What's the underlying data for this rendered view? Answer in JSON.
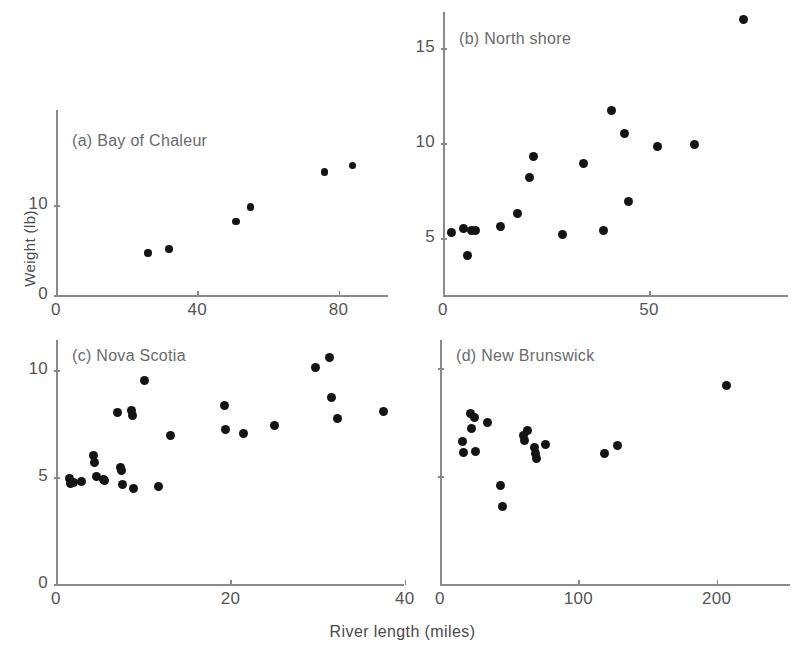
{
  "figure": {
    "xlabel": "River length (miles)",
    "ylabel": "Weight (lb)"
  },
  "chart_data": {
    "type": "scatter",
    "title": "",
    "xlabel": "River length (miles)",
    "ylabel": "Weight (lb)",
    "grid": false,
    "legend": "none",
    "marker": "filled circle",
    "marker_color": "#141414",
    "panels": [
      {
        "key": "a",
        "label": "(a) Bay of Chaleur",
        "xlim": [
          0,
          95
        ],
        "ylim": [
          0,
          16
        ],
        "xticks": [
          0,
          40,
          80
        ],
        "xticklabels": [
          "0",
          "40",
          "80"
        ],
        "yticks": [
          0,
          10
        ],
        "yticklabels": [
          "0",
          "10"
        ],
        "n": 6,
        "points": [
          {
            "x": 26,
            "y": 4.7
          },
          {
            "x": 32,
            "y": 5.1
          },
          {
            "x": 51,
            "y": 8.2
          },
          {
            "x": 55,
            "y": 9.8
          },
          {
            "x": 76,
            "y": 13.7
          },
          {
            "x": 84,
            "y": 14.4
          }
        ]
      },
      {
        "key": "b",
        "label": "(b) North shore",
        "xlim": [
          0,
          80
        ],
        "ylim": [
          3,
          17
        ],
        "xticks": [
          0,
          50
        ],
        "xticklabels": [
          "0",
          "50"
        ],
        "yticks": [
          5,
          10,
          15
        ],
        "yticklabels": [
          "5",
          "10",
          "15"
        ],
        "n": 20,
        "points": [
          {
            "x": 2,
            "y": 5.3
          },
          {
            "x": 5,
            "y": 5.5
          },
          {
            "x": 6,
            "y": 4.1
          },
          {
            "x": 7,
            "y": 5.4
          },
          {
            "x": 8,
            "y": 5.4
          },
          {
            "x": 14,
            "y": 5.6
          },
          {
            "x": 18,
            "y": 6.3
          },
          {
            "x": 21,
            "y": 8.2
          },
          {
            "x": 22,
            "y": 9.3
          },
          {
            "x": 29,
            "y": 5.2
          },
          {
            "x": 34,
            "y": 8.9
          },
          {
            "x": 39,
            "y": 5.4
          },
          {
            "x": 41,
            "y": 11.7
          },
          {
            "x": 44,
            "y": 10.5
          },
          {
            "x": 45,
            "y": 6.9
          },
          {
            "x": 52,
            "y": 9.8
          },
          {
            "x": 61,
            "y": 9.9
          },
          {
            "x": 73,
            "y": 16.5
          }
        ]
      },
      {
        "key": "c",
        "label": "(c) Nova Scotia",
        "xlim": [
          0,
          40
        ],
        "ylim": [
          0,
          11
        ],
        "xticks": [
          0,
          20,
          40
        ],
        "xticklabels": [
          "0",
          "20",
          "40"
        ],
        "yticks": [
          0,
          5,
          10
        ],
        "yticklabels": [
          "0",
          "5",
          "10"
        ],
        "n": 28,
        "points": [
          {
            "x": 1.6,
            "y": 4.95
          },
          {
            "x": 1.7,
            "y": 4.7
          },
          {
            "x": 2.0,
            "y": 4.75
          },
          {
            "x": 2.9,
            "y": 4.8
          },
          {
            "x": 4.3,
            "y": 6.0
          },
          {
            "x": 4.4,
            "y": 5.7
          },
          {
            "x": 4.6,
            "y": 5.0
          },
          {
            "x": 5.4,
            "y": 4.9
          },
          {
            "x": 5.6,
            "y": 4.85
          },
          {
            "x": 7.0,
            "y": 8.0
          },
          {
            "x": 7.4,
            "y": 5.45
          },
          {
            "x": 7.5,
            "y": 5.3
          },
          {
            "x": 7.6,
            "y": 4.65
          },
          {
            "x": 8.7,
            "y": 8.1
          },
          {
            "x": 8.8,
            "y": 7.85
          },
          {
            "x": 8.9,
            "y": 4.45
          },
          {
            "x": 10.2,
            "y": 9.5
          },
          {
            "x": 11.8,
            "y": 4.55
          },
          {
            "x": 13.1,
            "y": 6.95
          },
          {
            "x": 19.3,
            "y": 8.35
          },
          {
            "x": 19.4,
            "y": 7.2
          },
          {
            "x": 21.5,
            "y": 7.05
          },
          {
            "x": 25.0,
            "y": 7.4
          },
          {
            "x": 29.8,
            "y": 10.1
          },
          {
            "x": 31.4,
            "y": 10.6
          },
          {
            "x": 31.6,
            "y": 8.7
          },
          {
            "x": 32.3,
            "y": 7.75
          },
          {
            "x": 37.6,
            "y": 8.05
          }
        ]
      },
      {
        "key": "d",
        "label": "(d) New Brunswick",
        "xlim": [
          0,
          240
        ],
        "ylim": [
          0,
          11
        ],
        "xticks": [
          0,
          100,
          200
        ],
        "xticklabels": [
          "0",
          "100",
          "200"
        ],
        "yticks": [
          5,
          10
        ],
        "yticklabels": [
          "",
          ""
        ],
        "n": 25,
        "points": [
          {
            "x": 16,
            "y": 6.6
          },
          {
            "x": 17,
            "y": 6.1
          },
          {
            "x": 22,
            "y": 7.9
          },
          {
            "x": 23,
            "y": 7.2
          },
          {
            "x": 25,
            "y": 7.7
          },
          {
            "x": 26,
            "y": 6.15
          },
          {
            "x": 34,
            "y": 7.5
          },
          {
            "x": 44,
            "y": 4.55
          },
          {
            "x": 45,
            "y": 3.6
          },
          {
            "x": 60,
            "y": 6.9
          },
          {
            "x": 61,
            "y": 6.65
          },
          {
            "x": 63,
            "y": 7.1
          },
          {
            "x": 68,
            "y": 6.3
          },
          {
            "x": 69,
            "y": 6.05
          },
          {
            "x": 70,
            "y": 5.8
          },
          {
            "x": 76,
            "y": 6.45
          },
          {
            "x": 119,
            "y": 6.05
          },
          {
            "x": 128,
            "y": 6.4
          },
          {
            "x": 207,
            "y": 9.2
          }
        ]
      }
    ]
  }
}
